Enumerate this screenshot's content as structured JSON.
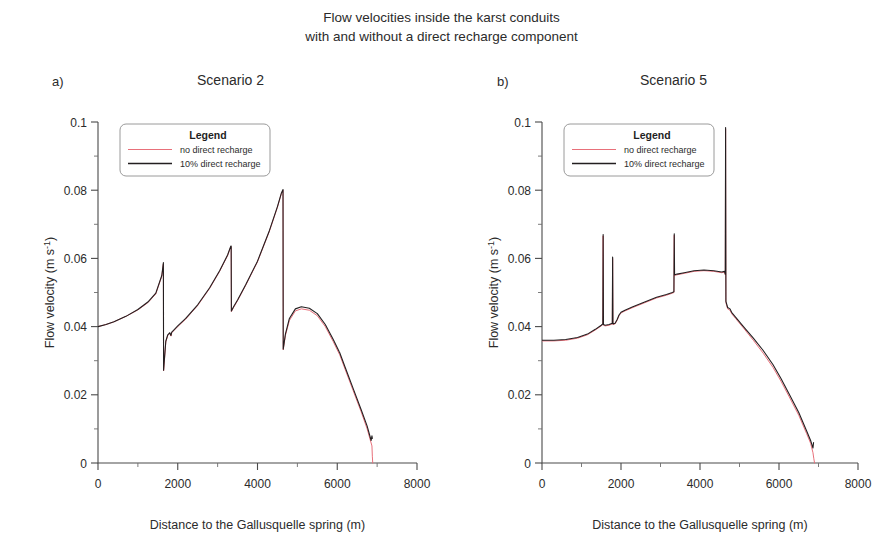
{
  "figure": {
    "title_line1": "Flow velocities inside the karst conduits",
    "title_line2": "with and without a direct recharge component"
  },
  "axis": {
    "xlabel": "Distance to the Gallusquelle spring (m)",
    "ylabel_main": "Flow velocity (m s",
    "ylabel_sup": "-1",
    "ylabel_close": ")",
    "xticks": [
      "0",
      "2000",
      "4000",
      "6000",
      "8000"
    ],
    "yticks": [
      "0",
      "0.02",
      "0.04",
      "0.06",
      "0.08",
      "0.1"
    ]
  },
  "legend": {
    "title": "Legend",
    "items": [
      {
        "label": "no direct recharge",
        "color": "#e8707a"
      },
      {
        "label": "10% direct recharge",
        "color": "#231f20"
      }
    ]
  },
  "panels": [
    {
      "letter": "a)",
      "subtitle": "Scenario 2"
    },
    {
      "letter": "b)",
      "subtitle": "Scenario 5"
    }
  ],
  "chart_data": [
    {
      "type": "line",
      "title": "Scenario 2",
      "panel": "a)",
      "xlabel": "Distance to the Gallusquelle spring (m)",
      "ylabel": "Flow velocity (m s-1)",
      "xlim": [
        0,
        8000
      ],
      "ylim": [
        0,
        0.1
      ],
      "xticks": [
        0,
        2000,
        4000,
        6000,
        8000
      ],
      "yticks": [
        0,
        0.02,
        0.04,
        0.06,
        0.08,
        0.1
      ],
      "xminor": 1000,
      "yminor": 0.01,
      "grid": false,
      "legend_position": "top-left",
      "series": [
        {
          "name": "no direct recharge",
          "color": "#e8707a",
          "x": [
            0,
            200,
            400,
            700,
            1000,
            1250,
            1450,
            1600,
            1640,
            1645,
            1700,
            1750,
            1800,
            1830,
            1850,
            1900,
            2000,
            2200,
            2500,
            2800,
            3050,
            3250,
            3330,
            3340,
            3345,
            3400,
            3500,
            3700,
            4000,
            4300,
            4500,
            4600,
            4640,
            4645,
            4700,
            4800,
            4950,
            5100,
            5300,
            5500,
            5700,
            5900,
            6050,
            6060,
            6200,
            6400,
            6600,
            6750,
            6870,
            6880,
            6890
          ],
          "y": [
            0.04,
            0.0406,
            0.0414,
            0.043,
            0.0449,
            0.047,
            0.0496,
            0.0548,
            0.0584,
            0.027,
            0.0355,
            0.0374,
            0.038,
            0.0372,
            0.0382,
            0.0388,
            0.04,
            0.0422,
            0.0462,
            0.0512,
            0.0562,
            0.0608,
            0.0634,
            0.0634,
            0.0444,
            0.0456,
            0.0476,
            0.052,
            0.059,
            0.068,
            0.075,
            0.079,
            0.08,
            0.0332,
            0.0374,
            0.0418,
            0.0446,
            0.0452,
            0.0448,
            0.0432,
            0.04,
            0.0356,
            0.032,
            0.0318,
            0.0274,
            0.0212,
            0.015,
            0.01,
            0.005,
            0.002,
            0.0
          ]
        },
        {
          "name": "10% direct recharge",
          "color": "#231f20",
          "x": [
            0,
            200,
            400,
            700,
            1000,
            1250,
            1450,
            1600,
            1640,
            1645,
            1700,
            1750,
            1800,
            1830,
            1850,
            1900,
            2000,
            2200,
            2500,
            2800,
            3050,
            3250,
            3330,
            3340,
            3345,
            3400,
            3500,
            3700,
            4000,
            4300,
            4500,
            4600,
            4640,
            4645,
            4700,
            4800,
            4950,
            5100,
            5300,
            5500,
            5700,
            5900,
            6050,
            6060,
            6200,
            6400,
            6600,
            6750,
            6850,
            6870,
            6880
          ],
          "y": [
            0.04,
            0.0406,
            0.0414,
            0.043,
            0.045,
            0.0472,
            0.0498,
            0.055,
            0.0588,
            0.0272,
            0.0357,
            0.0376,
            0.0382,
            0.0374,
            0.0384,
            0.039,
            0.0402,
            0.0424,
            0.0464,
            0.0514,
            0.0564,
            0.061,
            0.0636,
            0.0636,
            0.0446,
            0.0458,
            0.0478,
            0.0522,
            0.0592,
            0.0682,
            0.0752,
            0.0792,
            0.0802,
            0.0334,
            0.0378,
            0.0424,
            0.0452,
            0.0458,
            0.0454,
            0.0438,
            0.0406,
            0.0362,
            0.0326,
            0.0324,
            0.028,
            0.0218,
            0.0156,
            0.0108,
            0.0066,
            0.008,
            0.0072
          ]
        }
      ]
    },
    {
      "type": "line",
      "title": "Scenario 5",
      "panel": "b)",
      "xlabel": "Distance to the Gallusquelle spring (m)",
      "ylabel": "Flow velocity (m s-1)",
      "xlim": [
        0,
        8000
      ],
      "ylim": [
        0,
        0.1
      ],
      "xticks": [
        0,
        2000,
        4000,
        6000,
        8000
      ],
      "yticks": [
        0,
        0.02,
        0.04,
        0.06,
        0.08,
        0.1
      ],
      "xminor": 1000,
      "yminor": 0.01,
      "grid": false,
      "legend_position": "top-left",
      "series": [
        {
          "name": "no direct recharge",
          "color": "#e8707a",
          "x": [
            0,
            300,
            600,
            900,
            1150,
            1350,
            1500,
            1540,
            1548,
            1556,
            1600,
            1700,
            1780,
            1788,
            1796,
            1850,
            1900,
            1950,
            2000,
            2100,
            2300,
            2600,
            2900,
            3150,
            3300,
            3340,
            3348,
            3356,
            3420,
            3600,
            3850,
            4100,
            4350,
            4550,
            4620,
            4640,
            4648,
            4656,
            4700,
            4760,
            4800,
            4900,
            5100,
            5350,
            5600,
            5850,
            6050,
            6250,
            6500,
            6700,
            6800,
            6860,
            6880,
            6900
          ],
          "y": [
            0.0358,
            0.0358,
            0.036,
            0.0366,
            0.0376,
            0.039,
            0.0402,
            0.0406,
            0.0666,
            0.0404,
            0.0402,
            0.0404,
            0.0408,
            0.06,
            0.0406,
            0.0408,
            0.0418,
            0.0432,
            0.044,
            0.0446,
            0.0456,
            0.047,
            0.0484,
            0.0492,
            0.0498,
            0.05,
            0.0668,
            0.055,
            0.0552,
            0.0556,
            0.0562,
            0.0564,
            0.0562,
            0.0558,
            0.056,
            0.0552,
            0.098,
            0.047,
            0.0452,
            0.0448,
            0.0438,
            0.0424,
            0.0396,
            0.036,
            0.0322,
            0.028,
            0.024,
            0.0196,
            0.014,
            0.0086,
            0.0058,
            0.003,
            0.0014,
            0.0
          ]
        },
        {
          "name": "10% direct recharge",
          "color": "#231f20",
          "x": [
            0,
            300,
            600,
            900,
            1150,
            1350,
            1500,
            1540,
            1548,
            1556,
            1600,
            1700,
            1780,
            1788,
            1796,
            1850,
            1900,
            1950,
            2000,
            2100,
            2300,
            2600,
            2900,
            3150,
            3300,
            3340,
            3348,
            3356,
            3420,
            3600,
            3850,
            4100,
            4350,
            4550,
            4620,
            4640,
            4648,
            4656,
            4700,
            4760,
            4800,
            4900,
            5100,
            5350,
            5600,
            5850,
            6050,
            6250,
            6500,
            6700,
            6800,
            6860,
            6875
          ],
          "y": [
            0.036,
            0.036,
            0.0362,
            0.0368,
            0.0378,
            0.0392,
            0.0404,
            0.0408,
            0.067,
            0.0406,
            0.0404,
            0.0406,
            0.041,
            0.0604,
            0.0408,
            0.041,
            0.042,
            0.0434,
            0.0442,
            0.0448,
            0.0458,
            0.0472,
            0.0486,
            0.0494,
            0.05,
            0.0502,
            0.0672,
            0.0552,
            0.0554,
            0.0558,
            0.0564,
            0.0566,
            0.0564,
            0.056,
            0.0562,
            0.0554,
            0.0984,
            0.0474,
            0.0456,
            0.0452,
            0.0442,
            0.0428,
            0.04,
            0.0366,
            0.033,
            0.0288,
            0.0248,
            0.0204,
            0.0148,
            0.0094,
            0.0066,
            0.0044,
            0.006
          ]
        }
      ]
    }
  ]
}
